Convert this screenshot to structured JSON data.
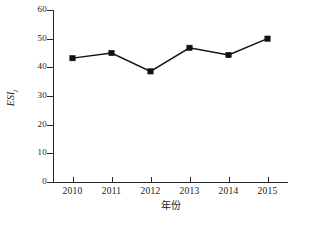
{
  "chart_data": {
    "type": "line",
    "title": "",
    "xlabel": "年份",
    "ylabel": "ESI",
    "ylabel_sub": "j",
    "categories": [
      "2010",
      "2011",
      "2012",
      "2013",
      "2014",
      "2015"
    ],
    "values": [
      43.2,
      45.0,
      38.6,
      46.8,
      44.3,
      50.0
    ],
    "series": [
      {
        "name": "ESIj",
        "values": [
          43.2,
          45.0,
          38.6,
          46.8,
          44.3,
          50.0
        ]
      }
    ],
    "ylim": [
      0,
      60
    ],
    "ytick_labels": [
      "0",
      "10",
      "20",
      "30",
      "40",
      "50",
      "60"
    ],
    "ytick_values": [
      0,
      10,
      20,
      30,
      40,
      50,
      60
    ],
    "xtick_labels": [
      "2010",
      "2011",
      "2012",
      "2013",
      "2014",
      "2015"
    ],
    "grid": false,
    "legend": "none",
    "marker": "square",
    "line_color": "#111111",
    "marker_color": "#111111",
    "axis_color": "#262626",
    "background": "#ffffff"
  }
}
